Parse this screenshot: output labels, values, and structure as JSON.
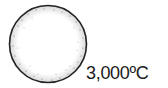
{
  "diagram": {
    "shape": "circle-star",
    "label": "3,000ºC",
    "colors": {
      "outline": "#222222",
      "fill": "#ffffff",
      "stipple": "#555555"
    }
  }
}
